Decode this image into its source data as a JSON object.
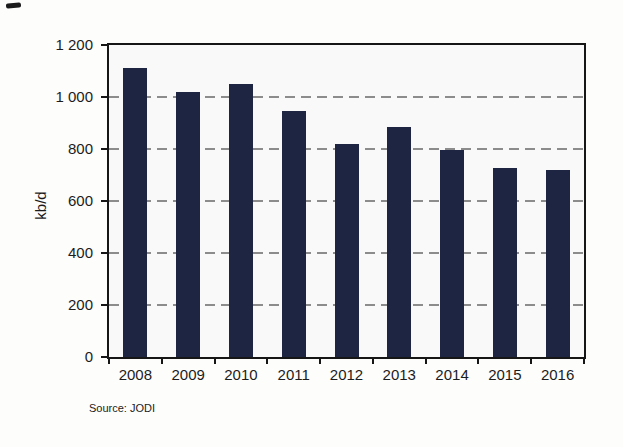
{
  "page": {
    "background": "#fdfdfc"
  },
  "chart_data": {
    "type": "bar",
    "title": "",
    "ylabel": "kb/d",
    "xlabel": "",
    "source_label": "Source: JODI",
    "categories": [
      "2008",
      "2009",
      "2010",
      "2011",
      "2012",
      "2013",
      "2014",
      "2015",
      "2016"
    ],
    "values": [
      1110,
      1020,
      1050,
      945,
      820,
      885,
      795,
      725,
      720
    ],
    "ylim": [
      0,
      1200
    ],
    "yticks": [
      {
        "value": 0,
        "label": "0"
      },
      {
        "value": 200,
        "label": "200"
      },
      {
        "value": 400,
        "label": "400"
      },
      {
        "value": 600,
        "label": "600"
      },
      {
        "value": 800,
        "label": "800"
      },
      {
        "value": 1000,
        "label": "1 000"
      },
      {
        "value": 1200,
        "label": "1 200"
      }
    ],
    "gridline_values": [
      200,
      400,
      600,
      800,
      1000
    ],
    "grid": "horizontal-dashed",
    "legend": "none",
    "bar_color": "#1d2542",
    "grid_color": "#8c8c8c",
    "axis_color": "#161616"
  }
}
